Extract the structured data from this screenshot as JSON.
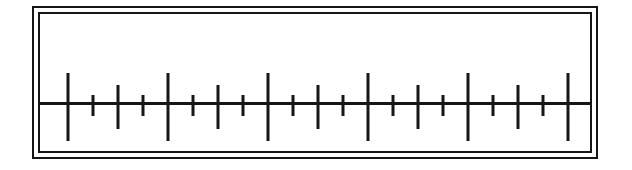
{
  "figure": {
    "kind": "ruler-scale",
    "width": 632,
    "height": 170,
    "background_color": "#ffffff",
    "ink_color": "#161616"
  },
  "frame": {
    "style": "double-rule-border",
    "outer_border_width": 2,
    "inner_border_width": 2,
    "gap": 4,
    "border_color": "#161616"
  },
  "chart_data": {
    "type": "scatter",
    "subtitle": "",
    "xlabel": "",
    "ylabel": "",
    "orientation": "horizontal",
    "grid": false,
    "legend": false,
    "axis": {
      "baseline_y": 88,
      "line_thickness": 3,
      "color": "#161616",
      "x_start": 0,
      "x_end": 550
    },
    "tick_levels": [
      {
        "name": "major",
        "length_above": 31,
        "length_below": 37,
        "thickness": 3,
        "count": 6
      },
      {
        "name": "medium",
        "length_above": 19,
        "length_below": 25,
        "thickness": 3,
        "count": 5
      },
      {
        "name": "minor",
        "length_above": 9,
        "length_below": 12,
        "thickness": 3,
        "count": 10
      }
    ],
    "x": [
      28,
      53,
      78,
      103,
      128,
      153,
      178,
      203,
      228,
      253,
      278,
      303,
      328,
      353,
      378,
      403,
      428,
      453,
      478,
      503,
      528
    ],
    "tick_sequence": [
      "major",
      "minor",
      "medium",
      "minor",
      "major",
      "minor",
      "medium",
      "minor",
      "major",
      "minor",
      "medium",
      "minor",
      "major",
      "minor",
      "medium",
      "minor",
      "major",
      "minor",
      "medium",
      "minor",
      "major"
    ],
    "tick_labels": []
  }
}
